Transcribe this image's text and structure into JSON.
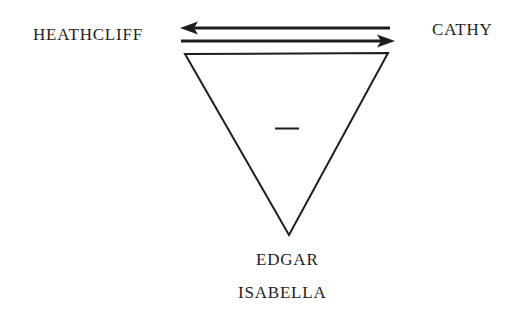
{
  "diagram": {
    "nodes": {
      "left": "HEATHCLIFF",
      "right": "CATHY",
      "bottom_1": "EDGAR",
      "bottom_2": "ISABELLA"
    },
    "edges": [
      {
        "from": "CATHY",
        "to": "HEATHCLIFF",
        "direction": "left"
      },
      {
        "from": "HEATHCLIFF",
        "to": "CATHY",
        "direction": "right"
      }
    ],
    "triangle": {
      "orientation": "inverted",
      "inner_sign": "−"
    },
    "colors": {
      "ink": "#1e1e1e",
      "background": "#ffffff"
    }
  }
}
